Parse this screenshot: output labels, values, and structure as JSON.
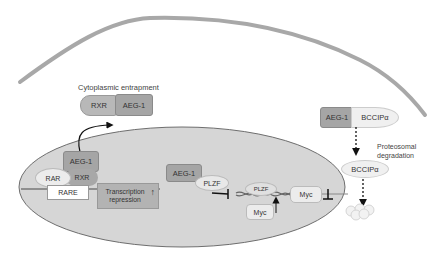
{
  "diagram": {
    "labels": {
      "cytoplasmic_entrapment": "Cytoplasmic entrapment",
      "proteosomal_line1": "Proteosomal",
      "proteosomal_line2": "degradation",
      "transcription_line1": "Transcription",
      "transcription_line2": "repression"
    },
    "cytoplasm_complex": {
      "rxr": "RXR",
      "aeg1": "AEG-1"
    },
    "nucleus_left": {
      "aeg1": "AEG-1",
      "rar": "RAR",
      "rxr": "RXR",
      "rare": "RARE"
    },
    "nucleus_middle": {
      "aeg1": "AEG-1",
      "plzf_free": "PLZF",
      "plzf_bound": "PLZF",
      "myc_lower": "Myc",
      "myc_right": "Myc"
    },
    "right_pathway": {
      "aeg1": "AEG-1",
      "bccip_bound": "BCCIPα",
      "bccip_free": "BCCIPα"
    },
    "colors": {
      "membrane": "#a8a8a8",
      "nucleus_fill": "#d6d6d6",
      "nucleus_stroke": "#6e6e6e",
      "protein_dark": "#a5a5a5",
      "protein_light": "#e6e6e6",
      "rxr_cyto": "#b8b8b8"
    }
  }
}
